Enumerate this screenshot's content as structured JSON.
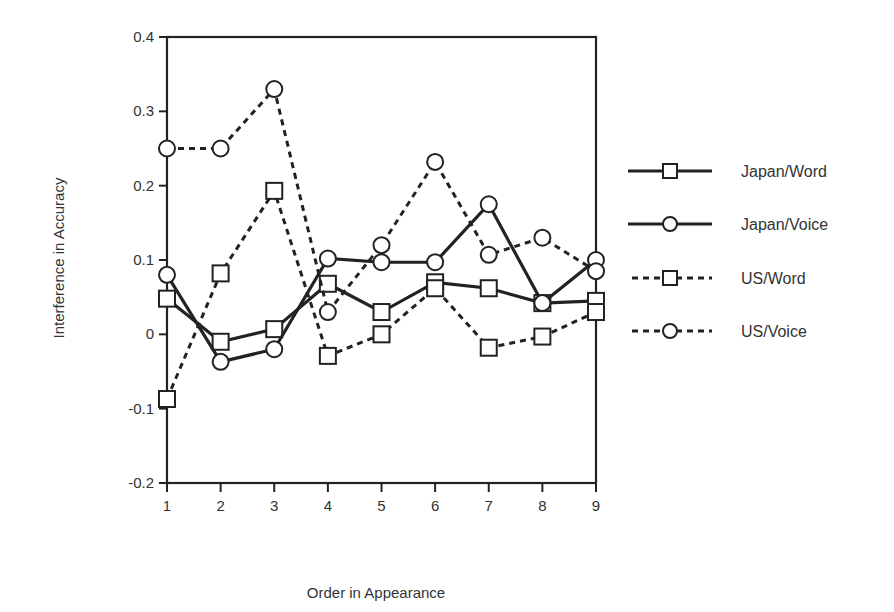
{
  "chart_data": {
    "type": "line",
    "title": "",
    "xlabel": "Order in Appearance",
    "ylabel": "Interference in Accuracy",
    "x": [
      1,
      2,
      3,
      4,
      5,
      6,
      7,
      8,
      9
    ],
    "xticks": [
      "1",
      "2",
      "3",
      "4",
      "5",
      "6",
      "7",
      "8",
      "9"
    ],
    "yticks": [
      "0.4",
      "0.3",
      "0.2",
      "0.1",
      "0",
      "-0.1",
      "-0.2"
    ],
    "ylim": [
      -0.2,
      0.4
    ],
    "xlim": [
      1,
      9
    ],
    "grid": false,
    "legend_position": "right",
    "series": [
      {
        "name": "Japan/Word",
        "line": "solid",
        "marker": "square",
        "values": [
          0.048,
          -0.01,
          0.007,
          0.068,
          0.03,
          0.07,
          0.062,
          0.042,
          0.045
        ]
      },
      {
        "name": "Japan/Voice",
        "line": "solid",
        "marker": "circle",
        "values": [
          0.08,
          -0.037,
          -0.02,
          0.102,
          0.097,
          0.097,
          0.175,
          0.042,
          0.1
        ]
      },
      {
        "name": "US/Word",
        "line": "dashed",
        "marker": "square",
        "values": [
          -0.087,
          0.082,
          0.193,
          -0.029,
          0.0,
          0.062,
          -0.018,
          -0.003,
          0.03
        ]
      },
      {
        "name": "US/Voice",
        "line": "dashed",
        "marker": "circle",
        "values": [
          0.25,
          0.25,
          0.33,
          0.03,
          0.12,
          0.232,
          0.107,
          0.13,
          0.085
        ]
      }
    ]
  }
}
